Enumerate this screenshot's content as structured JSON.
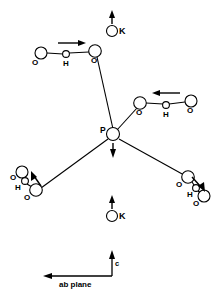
{
  "figure": {
    "background_color": "#ffffff",
    "stroke_color": "#000000",
    "width": 219,
    "height": 291
  },
  "atoms": {
    "phosphorus": {
      "label": "P",
      "x": 113,
      "y": 134,
      "r": 6.5
    },
    "potassium_top": {
      "label": "K",
      "x": 112,
      "y": 31,
      "r": 5.5
    },
    "potassium_bottom": {
      "label": "K",
      "x": 112,
      "y": 216,
      "r": 5.5
    },
    "oxygen_upper_left_far": {
      "label": "O",
      "x": 41,
      "y": 53,
      "r": 6.0
    },
    "hydrogen_upper_left": {
      "label": "H",
      "x": 66,
      "y": 54,
      "r": 3.4
    },
    "oxygen_upper_left_near": {
      "label": "O",
      "x": 95,
      "y": 51,
      "r": 6.3
    },
    "oxygen_right_near": {
      "label": "O",
      "x": 140,
      "y": 103,
      "r": 6.3
    },
    "hydrogen_right": {
      "label": "H",
      "x": 166,
      "y": 105,
      "r": 3.4
    },
    "oxygen_right_far": {
      "label": "O",
      "x": 191,
      "y": 101,
      "r": 6.0
    },
    "oxygen_lower_left_near": {
      "label": "O",
      "x": 36,
      "y": 190,
      "r": 6.3
    },
    "hydrogen_lower_left": {
      "label": "H",
      "x": 25,
      "y": 181,
      "r": 3.4
    },
    "oxygen_lower_left_far": {
      "label": "O",
      "x": 22,
      "y": 172,
      "r": 6.0
    },
    "oxygen_lower_right_near": {
      "label": "O",
      "x": 188,
      "y": 177,
      "r": 6.3
    },
    "hydrogen_lower_right": {
      "label": "H",
      "x": 196,
      "y": 188,
      "r": 3.4
    },
    "oxygen_lower_right_far": {
      "label": "O",
      "x": 204,
      "y": 196,
      "r": 6.0
    }
  },
  "arrows": {
    "potassium_top_arrow": {
      "direction": "up",
      "label": "K+ displacement along c"
    },
    "potassium_bottom_arrow": {
      "direction": "up",
      "label": "K+ displacement along c"
    },
    "phosphorus_arrow": {
      "direction": "down",
      "label": "P displacement along -c"
    },
    "upper_left_hbond_arrow": {
      "direction": "right",
      "label": "proton shift"
    },
    "right_hbond_arrow": {
      "direction": "left",
      "label": "proton shift"
    },
    "lower_left_arrow": {
      "direction": "up-left",
      "label": "oxygen displacement"
    },
    "lower_right_arrow": {
      "direction": "down-right",
      "label": "oxygen displacement"
    }
  },
  "axes": {
    "vertical_label": "c",
    "horizontal_label": "ab plane"
  }
}
